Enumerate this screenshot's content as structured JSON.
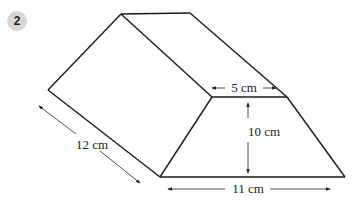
{
  "question_number": "2",
  "shape": "trapezoidal prism",
  "labels": {
    "top_width": "5 cm",
    "height": "10 cm",
    "bottom_width": "11 cm",
    "length": "12 cm"
  },
  "colors": {
    "line": "#1a1a1a",
    "badge": "#d6d6d6"
  }
}
